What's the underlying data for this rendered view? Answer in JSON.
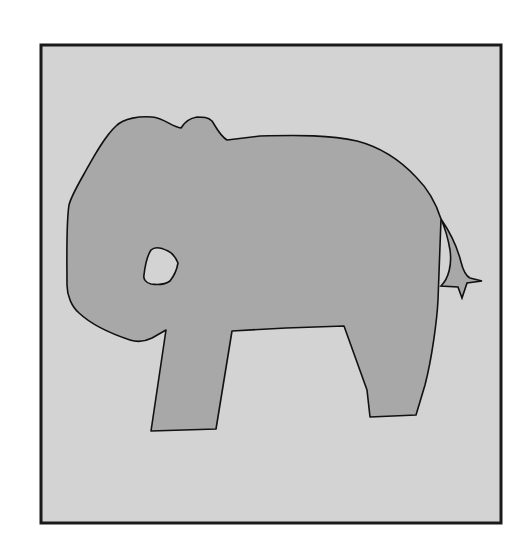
{
  "figure": {
    "colors": {
      "page_background": "#ffffff",
      "panel_fill": "#d3d3d3",
      "panel_border": "#1a1a1a",
      "elephant_fill": "#a8a8a8",
      "elephant_outline": "#111111",
      "eye_fill": "#d3d3d3"
    },
    "panel": {
      "x": 41,
      "y": 45,
      "width": 460,
      "height": 478,
      "border_width": 3
    },
    "parts": {
      "body": "body-outline",
      "eye": "eye-hole",
      "tail": "tail",
      "front_leg": "front-leg",
      "back_leg": "back-leg"
    }
  }
}
